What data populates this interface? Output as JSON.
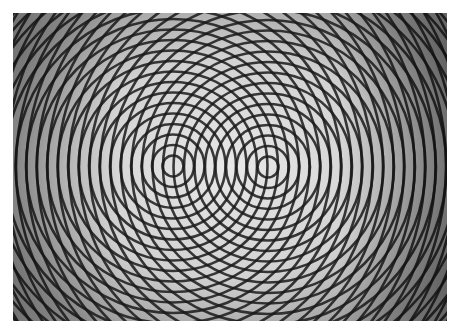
{
  "image": {
    "subject": "two-source circular wave interference pattern",
    "description": "Two sets of concentric black rings overlapping on a light gray background, producing moiré interference fringes",
    "frame": {
      "x": 13,
      "y": 13,
      "width": 434,
      "height": 308
    },
    "sources": [
      {
        "name": "left-source",
        "cx": 160,
        "cy": 153
      },
      {
        "name": "right-source",
        "cx": 255,
        "cy": 154
      }
    ],
    "ring_spacing": 10.5,
    "ring_count": 34,
    "colors": {
      "background_light": "#e6e6e6",
      "background_dark": "#8a8a8a",
      "ring": "#1a1a1a",
      "page": "#ffffff"
    }
  }
}
